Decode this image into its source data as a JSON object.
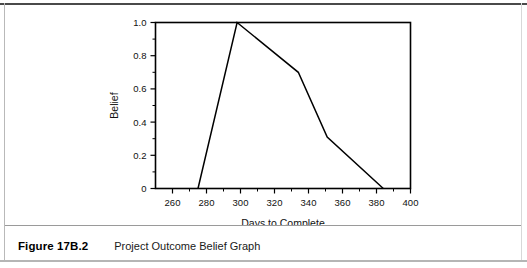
{
  "figure": {
    "label": "Figure 17B.2",
    "caption": "Project Outcome Belief Graph"
  },
  "chart_data": {
    "type": "line",
    "title": "",
    "xlabel": "Days to Complete",
    "ylabel": "Belief",
    "xlim": [
      250,
      400
    ],
    "ylim": [
      0,
      1.0
    ],
    "xticks": [
      260,
      280,
      300,
      320,
      340,
      360,
      380,
      400
    ],
    "xtick_labels": [
      "260",
      "280",
      "300",
      "320",
      "340",
      "360",
      "380",
      "400"
    ],
    "yticks": [
      0,
      0.2,
      0.4,
      0.6,
      0.8,
      1.0
    ],
    "ytick_labels": [
      "0",
      "0.2",
      "0.4",
      "0.6",
      "0.8",
      "1.0"
    ],
    "minor_xticks": [
      270,
      290,
      310,
      330,
      350,
      370,
      390
    ],
    "minor_yticks": [
      0.1,
      0.3,
      0.5,
      0.7,
      0.9
    ],
    "grid": false,
    "legend": false,
    "line_color": "#000000",
    "frame_color": "#000000",
    "series": [
      {
        "name": "Belief",
        "x": [
          275,
          298,
          334,
          351,
          384
        ],
        "y": [
          0.0,
          1.0,
          0.7,
          0.31,
          0.0
        ]
      }
    ]
  }
}
